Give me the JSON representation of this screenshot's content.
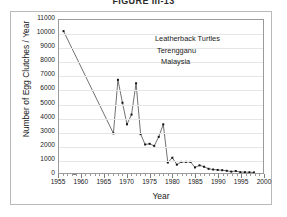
{
  "figure": {
    "caption": "FIGURE III-13"
  },
  "annotation": {
    "line1": "Leatherback Turtles",
    "line2": "Terengganu",
    "line3": "Malaysia"
  },
  "chart_data": {
    "type": "line",
    "title": "FIGURE III-13",
    "xlabel": "Year",
    "ylabel": "Number of Egg Clutches / Year",
    "xlim": [
      1955,
      2000
    ],
    "ylim": [
      0,
      11000
    ],
    "xtick_step": 5,
    "ytick_step": 1000,
    "x_tick_labels": [
      "1955",
      "1960",
      "1965",
      "1970",
      "1975",
      "1980",
      "1985",
      "1990",
      "1995",
      "2000"
    ],
    "y_tick_labels": [
      "0",
      "1000",
      "2000",
      "3000",
      "4000",
      "5000",
      "6000",
      "7000",
      "8000",
      "9000",
      "10000",
      "11000"
    ],
    "grid": "horizontal",
    "legend": "none",
    "marker": "square",
    "line_color": "#333333",
    "marker_color": "#111111",
    "annotations": [
      "Leatherback Turtles",
      "Terengganu",
      "Malaysia"
    ],
    "series": [
      {
        "name": "Egg clutches per year",
        "x": [
          1956,
          1967,
          1968,
          1969,
          1970,
          1971,
          1972,
          1973,
          1974,
          1975,
          1976,
          1977,
          1978,
          1979,
          1980,
          1981,
          1982,
          1983,
          1984,
          1985,
          1986,
          1987,
          1988,
          1989,
          1990,
          1991,
          1992,
          1993,
          1994,
          1995,
          1996,
          1997,
          1998
        ],
        "values": [
          10200,
          2850,
          6700,
          5050,
          3500,
          4200,
          6450,
          2800,
          2050,
          2100,
          1950,
          2600,
          3500,
          750,
          1100,
          600,
          800,
          800,
          800,
          400,
          550,
          450,
          300,
          250,
          220,
          200,
          160,
          100,
          140,
          60,
          60,
          50,
          40
        ]
      }
    ]
  }
}
